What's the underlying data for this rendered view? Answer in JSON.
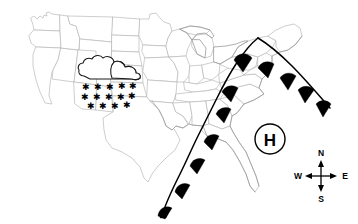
{
  "map": {
    "title": "United States Weather Map",
    "region": "Continental United States",
    "background_color": "#ffffff",
    "state_border_color": "#b9b9b9",
    "coastline_color": "#9a9a9a"
  },
  "pressure_systems": [
    {
      "type": "high-pressure",
      "label": "H",
      "color": "#000000",
      "x": 270,
      "y": 139,
      "radius": 15,
      "location": "Southeast United States"
    }
  ],
  "fronts": [
    {
      "type": "warm-front",
      "symbol": "filled-semicircle",
      "color": "#000000",
      "description": "Warm front extending from southwest Texas northeast through the Mississippi Valley and Ohio Valley to the Atlantic coast",
      "bumps": 11
    }
  ],
  "precipitation": [
    {
      "type": "snow",
      "symbol": "cloud-with-snowflakes",
      "location": "Northern Rockies / Northern Plains",
      "cloud_outline_color": "#1a1a1a",
      "snowflake_color": "#000000",
      "snowflake_count": 14
    }
  ],
  "compass": {
    "name": "compass-rose",
    "north": "N",
    "south": "S",
    "east": "E",
    "west": "W",
    "center_x": 321,
    "center_y": 176
  }
}
